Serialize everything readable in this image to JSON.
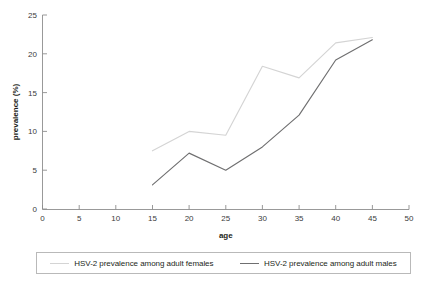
{
  "chart_data": {
    "type": "line",
    "title": "",
    "xlabel": "age",
    "ylabel": "prevalence (%)",
    "xlim": [
      0,
      50
    ],
    "ylim": [
      0,
      25
    ],
    "xticks": [
      0,
      5,
      10,
      15,
      20,
      25,
      30,
      35,
      40,
      45,
      50
    ],
    "yticks": [
      0,
      5,
      10,
      15,
      20,
      25
    ],
    "grid": false,
    "legend_position": "bottom",
    "x": [
      15,
      20,
      25,
      30,
      35,
      40,
      45
    ],
    "series": [
      {
        "name": "HSV-2 prevalence among adult females",
        "color": "#d4d4d4",
        "values": [
          7.5,
          10.0,
          9.5,
          18.4,
          16.9,
          21.4,
          22.1
        ]
      },
      {
        "name": "HSV-2 prevalence among adult males",
        "color": "#6f6f70",
        "values": [
          3.1,
          7.2,
          5.0,
          8.0,
          12.1,
          19.2,
          21.8
        ]
      }
    ]
  },
  "legend": {
    "items": [
      {
        "label": "HSV-2 prevalence among adult females",
        "color": "#d4d4d4"
      },
      {
        "label": "HSV-2 prevalence among adult males",
        "color": "#6f6f70"
      }
    ]
  },
  "axes": {
    "x_title": "age",
    "y_title": "prevalence (%)",
    "x_tick_labels": [
      "0",
      "5",
      "10",
      "15",
      "20",
      "25",
      "30",
      "35",
      "40",
      "45",
      "50"
    ],
    "y_tick_labels": [
      "0",
      "5",
      "10",
      "15",
      "20",
      "25"
    ]
  },
  "colors": {
    "axis": "#8d8d8d",
    "text": "#231f20",
    "background": "#ffffff",
    "legend_border": "#b9b9b9"
  }
}
